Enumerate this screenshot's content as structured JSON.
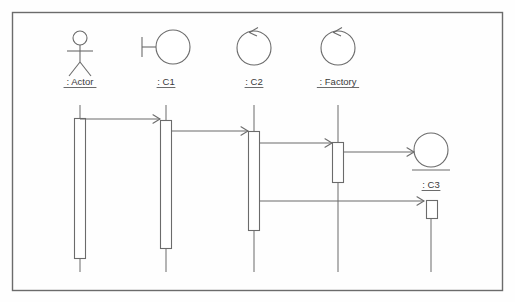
{
  "diagram": {
    "kind": "uml-sequence-diagram",
    "frame": {
      "x": 12,
      "y": 12,
      "width": 490,
      "height": 278,
      "stroke": "#6b6b6b"
    },
    "line_color": "#6b6b6b",
    "fill_color": "#ffffff",
    "participants": [
      {
        "id": "actor",
        "label": ": Actor",
        "icon": "actor-stick-figure-icon",
        "lifeline_x": 80,
        "label_x": 80,
        "label_y": 85,
        "head_cx": 80,
        "head_cy": 38,
        "head_r": 7,
        "activation": {
          "x": 74,
          "y": 118,
          "width": 11,
          "height": 140
        },
        "lifeline_top": 105,
        "lifeline_bottom": 272
      },
      {
        "id": "c1",
        "label": ": C1",
        "icon": "boundary-circle-icon",
        "lifeline_x": 166,
        "label_x": 166,
        "label_y": 85,
        "circle_cx": 173,
        "circle_cy": 47,
        "circle_r": 17,
        "activation": {
          "x": 160,
          "y": 120,
          "width": 11,
          "height": 128
        },
        "lifeline_top": 105,
        "lifeline_bottom": 272
      },
      {
        "id": "c2",
        "label": ": C2",
        "icon": "control-circle-arrow-icon",
        "lifeline_x": 254,
        "label_x": 254,
        "label_y": 85,
        "circle_cx": 254,
        "circle_cy": 48,
        "circle_r": 17,
        "activation": {
          "x": 248,
          "y": 131,
          "width": 11,
          "height": 99
        },
        "lifeline_top": 105,
        "lifeline_bottom": 272
      },
      {
        "id": "factory",
        "label": ": Factory",
        "icon": "control-circle-arrow-icon",
        "lifeline_x": 338,
        "label_x": 338,
        "label_y": 85,
        "circle_cx": 338,
        "circle_cy": 48,
        "circle_r": 17,
        "activation": {
          "x": 332,
          "y": 142,
          "width": 11,
          "height": 40
        },
        "lifeline_top": 105,
        "lifeline_bottom": 272
      },
      {
        "id": "c3",
        "label": ": C3",
        "icon": "entity-circle-underline-icon",
        "lifeline_x": 431,
        "label_x": 431,
        "label_y": 188,
        "circle_cx": 431,
        "circle_cy": 150,
        "circle_r": 17,
        "entity_base_y": 170,
        "activation": {
          "x": 426,
          "y": 200,
          "width": 11,
          "height": 18
        },
        "lifeline_top": 218,
        "lifeline_bottom": 272
      }
    ],
    "messages": [
      {
        "id": "m1",
        "from": "actor",
        "to": "c1",
        "x1": 80,
        "x2": 160,
        "y": 119,
        "arrow": "open"
      },
      {
        "id": "m2",
        "from": "c1",
        "to": "c2",
        "x1": 171,
        "x2": 248,
        "y": 131,
        "arrow": "open"
      },
      {
        "id": "m3",
        "from": "c2",
        "to": "factory",
        "x1": 259,
        "x2": 332,
        "y": 143,
        "arrow": "open"
      },
      {
        "id": "m4",
        "from": "factory",
        "to": "c3",
        "x1": 343,
        "x2": 414,
        "y": 152,
        "arrow": "open"
      },
      {
        "id": "m5",
        "from": "c2",
        "to": "c3",
        "x1": 259,
        "x2": 424,
        "y": 201,
        "arrow": "open"
      }
    ]
  }
}
